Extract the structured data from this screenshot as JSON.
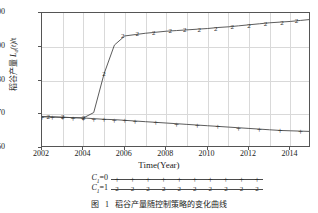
{
  "chart_data": {
    "type": "line",
    "title": "",
    "xlabel": "Time(Year)",
    "ylabel": "稻谷产量 L_a(t)/t",
    "ylabel_parts": {
      "prefix": "稻谷产量 ",
      "symbol": "L",
      "subscript": "a",
      "arg": "(t)",
      "unit": "/t"
    },
    "xlim": [
      2002,
      2015
    ],
    "ylim": [
      60,
      100
    ],
    "xticks": [
      2002,
      2004,
      2006,
      2008,
      2010,
      2012,
      2014
    ],
    "xtick_labels": [
      "2002",
      "2004",
      "2006",
      "2008",
      "2010",
      "2012",
      "2014"
    ],
    "yticks": [
      60,
      70,
      80,
      90,
      100
    ],
    "ytick_labels": [
      "60",
      "70",
      "80",
      "90",
      "100"
    ],
    "grid": true,
    "grid_color": "#d9d9d9",
    "line_color": "#4a4a4a",
    "legend_position": "below-axis",
    "x": [
      2002,
      2002.5,
      2003,
      2003.5,
      2004,
      2004.5,
      2005,
      2005.5,
      2006,
      2006.5,
      2007,
      2007.5,
      2008,
      2008.5,
      2009,
      2009.5,
      2010,
      2010.5,
      2011,
      2011.5,
      2012,
      2012.5,
      2013,
      2013.5,
      2014,
      2014.5,
      2015
    ],
    "series": [
      {
        "name": "C1=0",
        "marker": "+",
        "legend_label": "C₁=0",
        "values": [
          69.3,
          69.2,
          69.1,
          69.0,
          68.9,
          68.7,
          68.5,
          68.4,
          68.2,
          68.0,
          67.8,
          67.6,
          67.4,
          67.2,
          67.0,
          66.8,
          66.6,
          66.4,
          66.2,
          66.0,
          65.8,
          65.6,
          65.4,
          65.2,
          65.1,
          65.0,
          64.9
        ],
        "marker_x": [
          2002,
          2002.5,
          2003,
          2003.5,
          2004,
          2004.5,
          2005,
          2005.5,
          2006,
          2006.5,
          2007.5,
          2008.5,
          2009.5,
          2010.5,
          2011.5,
          2012.5,
          2013.5,
          2014.5
        ],
        "marker_y": [
          69.3,
          69.2,
          69.1,
          69.0,
          68.9,
          68.7,
          68.5,
          68.4,
          68.2,
          68.0,
          67.6,
          67.2,
          66.8,
          66.4,
          66.0,
          65.6,
          65.2,
          65.0
        ]
      },
      {
        "name": "C1=1",
        "marker": "2",
        "legend_label": "C₁=1",
        "values": [
          69.3,
          69.2,
          69.1,
          69.0,
          68.9,
          70.5,
          82.0,
          90.5,
          93.2,
          93.6,
          94.0,
          94.3,
          94.6,
          94.8,
          95.0,
          95.2,
          95.4,
          95.7,
          95.9,
          96.2,
          96.5,
          96.8,
          97.1,
          97.3,
          97.5,
          97.8,
          98.1
        ],
        "marker_x": [
          2002.3,
          2003.0,
          2004.0,
          2005.0,
          2005.9,
          2006.6,
          2007.4,
          2008.2,
          2008.9,
          2009.6,
          2010.4,
          2011.2,
          2012.0,
          2012.8,
          2013.6,
          2014.3,
          2015.0
        ],
        "marker_y": [
          69.25,
          69.1,
          68.9,
          82.0,
          93.2,
          93.7,
          94.2,
          94.6,
          94.9,
          95.1,
          95.4,
          95.8,
          96.2,
          96.6,
          97.0,
          97.5,
          98.1
        ]
      }
    ]
  },
  "axis": {
    "x_title": "Time(Year)"
  },
  "legend": {
    "rows": [
      {
        "label_prefix": "C",
        "label_sub": "1",
        "label_suffix": "=0",
        "marker": "+"
      },
      {
        "label_prefix": "C",
        "label_sub": "1",
        "label_suffix": "=1",
        "marker": "2"
      }
    ]
  },
  "caption": {
    "figure_word": "图",
    "number": "1",
    "text": "稻谷产量随控制策略的变化曲线"
  }
}
